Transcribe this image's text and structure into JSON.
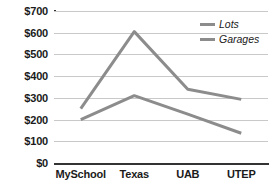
{
  "chart_data": {
    "type": "line",
    "title": "",
    "xlabel": "",
    "ylabel": "",
    "categories": [
      "MySchool",
      "Texas",
      "UAB",
      "UTEP"
    ],
    "series": [
      {
        "name": "Lots",
        "values": [
          250,
          605,
          340,
          293
        ],
        "color": "#8c8c8c"
      },
      {
        "name": "Garages",
        "values": [
          200,
          310,
          225,
          137
        ],
        "color": "#8c8c8c"
      }
    ],
    "ylim": [
      0,
      700
    ],
    "ytick_step": 100,
    "ytick_labels": [
      "$0",
      "$100",
      "$200",
      "$300",
      "$400",
      "$500",
      "$600",
      "$700"
    ],
    "ytick_values": [
      0,
      100,
      200,
      300,
      400,
      500,
      600,
      700
    ],
    "grid": true,
    "legend_position": "top-right",
    "axis_color": "#333333",
    "gridline_color": "#c9c9c9",
    "background_color": "#ffffff"
  },
  "legend": {
    "items": [
      {
        "label": "Lots",
        "color": "#8c8c8c"
      },
      {
        "label": "Garages",
        "color": "#8c8c8c"
      }
    ]
  }
}
